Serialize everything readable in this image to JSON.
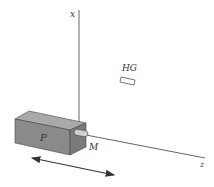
{
  "diagram": {
    "axes": {
      "x_label": "x",
      "z_label": "z"
    },
    "labels": {
      "box": "P",
      "connector": "M",
      "target": "HG"
    },
    "colors": {
      "background": "#ffffff",
      "line": "#555555",
      "box_front": "#8a8a8a",
      "box_top": "#a9a9a9",
      "box_side": "#7a7a7a",
      "arrow": "#333333"
    }
  }
}
